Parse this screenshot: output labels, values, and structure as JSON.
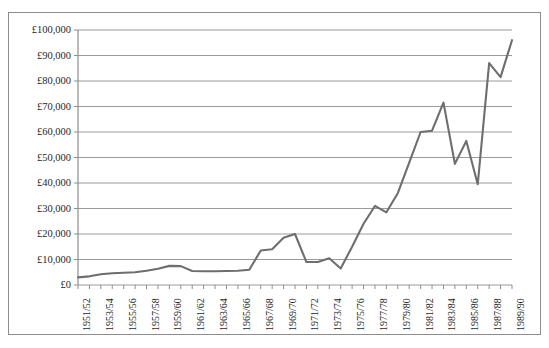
{
  "chart_data": {
    "type": "line",
    "title": "",
    "xlabel": "",
    "ylabel": "",
    "ylim": [
      0,
      100000
    ],
    "ytick_step": 10000,
    "grid": true,
    "legend": false,
    "legend_position": "none",
    "currency_symbol": "£",
    "line_color": "#6e6e6e",
    "grid_color": "#9a9a9a",
    "axis_color": "#8d8d8d",
    "y_ticks": [
      "£0",
      "£10,000",
      "£20,000",
      "£30,000",
      "£40,000",
      "£50,000",
      "£60,000",
      "£70,000",
      "£80,000",
      "£90,000",
      "£100,000"
    ],
    "categories": [
      "1951/52",
      "1952/53",
      "1953/54",
      "1954/55",
      "1955/56",
      "1956/57",
      "1957/58",
      "1958/59",
      "1959/60",
      "1960/61",
      "1961/62",
      "1962/63",
      "1963/64",
      "1964/65",
      "1965/66",
      "1966/67",
      "1967/68",
      "1968/69",
      "1969/70",
      "1970/71",
      "1971/72",
      "1972/73",
      "1973/74",
      "1974/75",
      "1975/76",
      "1976/77",
      "1977/78",
      "1978/79",
      "1979/80",
      "1980/81",
      "1981/82",
      "1982/83",
      "1983/84",
      "1984/85",
      "1985/86",
      "1986/87",
      "1987/88",
      "1988/89",
      "1989/90"
    ],
    "x_tick_labels_shown": [
      "1951/52",
      "1953/54",
      "1955/56",
      "1957/58",
      "1959/60",
      "1961/62",
      "1963/64",
      "1965/66",
      "1967/68",
      "1969/70",
      "1971/72",
      "1973/74",
      "1975/76",
      "1977/78",
      "1979/80",
      "1981/82",
      "1983/84",
      "1985/86",
      "1987/88",
      "1989/90"
    ],
    "values": [
      3000,
      3400,
      4200,
      4600,
      4800,
      5000,
      5600,
      6400,
      7500,
      7400,
      5500,
      5400,
      5400,
      5500,
      5600,
      6000,
      13500,
      14000,
      18500,
      20000,
      9000,
      9000,
      10500,
      6500,
      15000,
      24000,
      31000,
      28500,
      36000,
      48000,
      60000,
      60500,
      71500,
      47500,
      56500,
      39500,
      87000,
      81500,
      96000
    ]
  }
}
